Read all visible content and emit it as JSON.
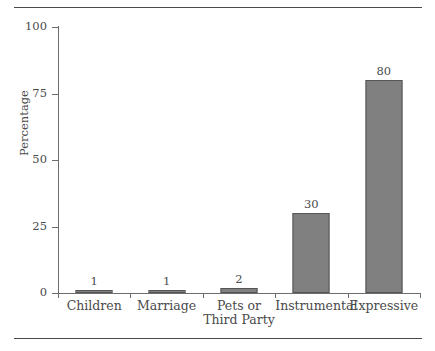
{
  "chart_data": {
    "type": "bar",
    "title": "",
    "subtitle": "",
    "xlabel": "",
    "ylabel": "Percentage",
    "categories": [
      "Children",
      "Marriage",
      "Pets or Third Party",
      "Instrumental",
      "Expressive"
    ],
    "category_lines": [
      [
        "Children"
      ],
      [
        "Marriage"
      ],
      [
        "Pets or",
        "Third Party"
      ],
      [
        "Instrumental"
      ],
      [
        "Expressive"
      ]
    ],
    "values": [
      1,
      1,
      2,
      30,
      80
    ],
    "value_labels": [
      "1",
      "1",
      "2",
      "30",
      "80"
    ],
    "ylim": [
      0,
      100
    ],
    "yticks": [
      0,
      25,
      50,
      75,
      100
    ],
    "ytick_labels": [
      "0",
      "25",
      "50",
      "75",
      "100"
    ],
    "grid": false,
    "legend": false,
    "legend_position": "none",
    "bar_color": "#808080",
    "bar_edge_color": "#555555",
    "axis_color": "#6d6d6d",
    "text_color": "#4a4a4a",
    "rule_color": "#4a4a4a",
    "background": "#ffffff"
  }
}
